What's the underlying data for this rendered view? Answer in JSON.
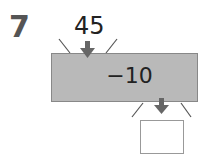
{
  "problem": {
    "number": "7",
    "input_value": "45",
    "operation": "−10",
    "answer": ""
  },
  "colors": {
    "machine_fill": "#b9b9b9",
    "arrow": "#666666"
  }
}
